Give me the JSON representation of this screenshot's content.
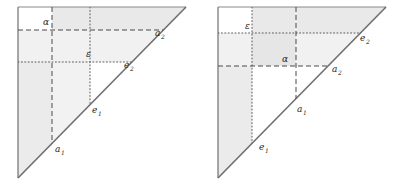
{
  "figure": {
    "type": "diagram",
    "panel_count": 2,
    "colors": {
      "stroke": "#6f6f6f",
      "hypotenuse": "#6f6f6f",
      "shade_light": "#f0f0f0",
      "shade_mid": "#e6e6e6",
      "label": "#231f20",
      "background": "#ffffff"
    }
  },
  "panels": [
    {
      "id": "left",
      "name": "left-diagram",
      "order": "alpha-above-epsilon",
      "lines": {
        "alpha": {
          "style": "dashed",
          "label": "α",
          "level": "upper"
        },
        "epsilon": {
          "style": "dotted",
          "label": "ε",
          "level": "lower"
        }
      },
      "labels": [
        {
          "name": "alpha-label",
          "text": "α",
          "x": 43,
          "y": 25
        },
        {
          "name": "epsilon-label",
          "text": "ε",
          "x": 86,
          "y": 57
        },
        {
          "name": "a2-label",
          "base": "a",
          "sub": "2",
          "x": 155,
          "y": 36
        },
        {
          "name": "e2-label",
          "base": "e",
          "sub": "2",
          "x": 124,
          "y": 68
        },
        {
          "name": "e1-label",
          "base": "e",
          "sub": "1",
          "x": 92,
          "y": 113
        },
        {
          "name": "a1-label",
          "base": "a",
          "sub": "1",
          "x": 55,
          "y": 152
        }
      ]
    },
    {
      "id": "right",
      "name": "right-diagram",
      "order": "epsilon-above-alpha",
      "lines": {
        "epsilon": {
          "style": "dotted",
          "label": "ε",
          "level": "upper"
        },
        "alpha": {
          "style": "dashed",
          "label": "α",
          "level": "lower"
        }
      },
      "labels": [
        {
          "name": "epsilon-label",
          "text": "ε",
          "x": 46,
          "y": 29
        },
        {
          "name": "alpha-label",
          "text": "α",
          "x": 83,
          "y": 62
        },
        {
          "name": "e2-label",
          "base": "e",
          "sub": "2",
          "x": 161,
          "y": 41
        },
        {
          "name": "a2-label",
          "base": "a",
          "sub": "2",
          "x": 133,
          "y": 72
        },
        {
          "name": "a1-label",
          "base": "a",
          "sub": "1",
          "x": 98,
          "y": 112
        },
        {
          "name": "e1-label",
          "base": "e",
          "sub": "1",
          "x": 60,
          "y": 150
        }
      ]
    }
  ]
}
